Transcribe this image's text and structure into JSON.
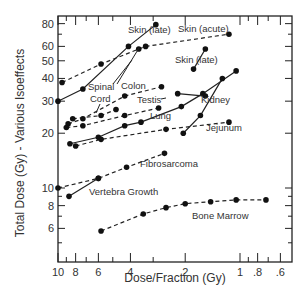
{
  "chart_data": {
    "type": "line",
    "title": "",
    "xlabel": "Dose/Fraction (Gy)",
    "ylabel": "Total Dose (Gy) - Various Isoeffects",
    "xscale": "log",
    "yscale": "log",
    "x_reversed": true,
    "xlim": [
      10,
      0.55
    ],
    "ylim": [
      3.9,
      88
    ],
    "grid": false,
    "legend": "inline labels",
    "x_ticks": [
      {
        "value": 10,
        "label": "10"
      },
      {
        "value": 8,
        "label": "8"
      },
      {
        "value": 6,
        "label": "6"
      },
      {
        "value": 4,
        "label": "4"
      },
      {
        "value": 2,
        "label": "2"
      },
      {
        "value": 1,
        "label": "1"
      },
      {
        "value": 0.8,
        "label": ".8"
      },
      {
        "value": 0.6,
        "label": ".6"
      }
    ],
    "y_ticks": [
      {
        "value": 80,
        "label": "80"
      },
      {
        "value": 60,
        "label": "60"
      },
      {
        "value": 50,
        "label": "50"
      },
      {
        "value": 40,
        "label": "40"
      },
      {
        "value": 30,
        "label": "30"
      },
      {
        "value": 20,
        "label": "20"
      },
      {
        "value": 10,
        "label": "10"
      },
      {
        "value": 8,
        "label": "8"
      },
      {
        "value": 6,
        "label": "6"
      }
    ],
    "series": [
      {
        "name": "Skin (late)",
        "style": "solid",
        "x": [
          10,
          7.3,
          4.1,
          2.9
        ],
        "y": [
          30,
          35,
          60,
          79
        ],
        "label_pos": [
          2.8,
          73
        ]
      },
      {
        "name": "Skin (acute)",
        "style": "dashed",
        "x": [
          9.5,
          5.8,
          3.6,
          3.3,
          1.15
        ],
        "y": [
          38,
          48,
          58,
          60,
          70
        ],
        "label_pos": [
          1.85,
          78
        ]
      },
      {
        "name": "Skin (late)",
        "style": "solid",
        "x": [
          1.8,
          1.55
        ],
        "y": [
          45,
          58
        ],
        "label_pos": [
          1.75,
          48
        ]
      },
      {
        "name": "Spinal Cord",
        "style": "dashed",
        "x": [
          8.3,
          5.8,
          4.8
        ],
        "y": [
          24,
          25,
          27
        ],
        "label_pos": [
          6.4,
          36
        ]
      },
      {
        "name": "Colon",
        "style": "dashed",
        "x": [
          8.8,
          7.3,
          4.3,
          2.7
        ],
        "y": [
          22.5,
          24,
          32,
          36
        ],
        "label_pos": [
          4.0,
          36
        ]
      },
      {
        "name": "Testis",
        "style": "dashed",
        "x": [
          9.0,
          7.3,
          4.3,
          2.8
        ],
        "y": [
          21.5,
          22,
          25,
          27.5
        ],
        "label_pos": [
          3.1,
          29
        ]
      },
      {
        "name": "Kidney",
        "style": "solid",
        "x": [
          8.6,
          6.0,
          4.3,
          3.5,
          2.1,
          1.6,
          1.05
        ],
        "y": [
          17.5,
          19,
          22,
          23,
          28,
          33,
          44
        ],
        "label_pos": [
          1.55,
          28
        ]
      },
      {
        "name": "Lung",
        "style": "solid",
        "x": [
          2.05,
          1.65,
          1.25
        ],
        "y": [
          20,
          25,
          40
        ],
        "label_pos": [
          2.5,
          24
        ]
      },
      {
        "name": "Kidney (second)",
        "style": "solid",
        "x": [
          2.2,
          1.55
        ],
        "y": [
          33,
          32
        ],
        "label_pos": null
      },
      {
        "name": "Jejunum",
        "style": "dashed",
        "x": [
          8.0,
          5.8,
          2.55,
          1.15
        ],
        "y": [
          17,
          18.5,
          21,
          23
        ],
        "label_pos": [
          1.45,
          20
        ]
      },
      {
        "name": "Fibrosarcoma",
        "style": "dashed",
        "x": [
          10,
          6.0,
          4.2,
          2.6
        ],
        "y": [
          10,
          11.3,
          13,
          15.5
        ],
        "label_pos": [
          2.7,
          12.8
        ]
      },
      {
        "name": "Vertebra Growth",
        "style": "solid",
        "x": [
          8.7,
          6.0
        ],
        "y": [
          9,
          11.3
        ],
        "label_pos": [
          6.5,
          9.8
        ]
      },
      {
        "name": "Bone Marrow",
        "style": "dashed",
        "x": [
          5.8,
          3.4,
          2.55,
          2.0,
          1.45,
          1.05,
          0.72
        ],
        "y": [
          5.8,
          7.2,
          7.8,
          8.2,
          8.4,
          8.6,
          8.6
        ],
        "label_pos": [
          1.55,
          6.9
        ]
      }
    ]
  },
  "labels": {
    "skin_late_top": "Skin (late)",
    "skin_acute": "Skin (acute)",
    "skin_late_right": "Skin (late)",
    "spinal": "Spinal",
    "cord": "Cord",
    "colon": "Colon",
    "testis": "Testis",
    "kidney": "Kidney",
    "lung": "Lung",
    "jejunum": "Jejunum",
    "fibrosarcoma": "Fibrosarcoma",
    "vertebra_growth": "Vertebra Growth",
    "bone_marrow": "Bone Marrow"
  }
}
